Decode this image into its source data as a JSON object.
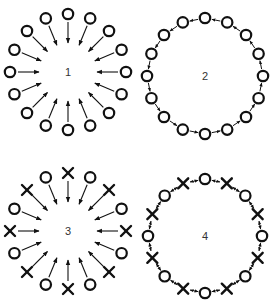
{
  "colors": {
    "stroke": "#111111",
    "label": "#333333",
    "background": "#ffffff"
  },
  "diagrams": [
    {
      "id": "1",
      "label": "1",
      "type": "centripetal",
      "center": [
        68,
        72
      ],
      "radius": 58,
      "node_count": 16,
      "nodes": [
        "O",
        "O",
        "O",
        "O",
        "O",
        "O",
        "O",
        "O",
        "O",
        "O",
        "O",
        "O",
        "O",
        "O",
        "O",
        "O"
      ],
      "arrows": "inward"
    },
    {
      "id": "2",
      "label": "2",
      "type": "ring",
      "center": [
        205,
        76
      ],
      "radius": 58,
      "node_count": 16,
      "nodes": [
        "O",
        "O",
        "O",
        "O",
        "O",
        "O",
        "O",
        "O",
        "O",
        "O",
        "O",
        "O",
        "O",
        "O",
        "O",
        "O"
      ],
      "arrows": "neighbor-single"
    },
    {
      "id": "3",
      "label": "3",
      "type": "centripetal",
      "center": [
        68,
        231
      ],
      "radius": 58,
      "node_count": 16,
      "nodes": [
        "X",
        "O",
        "X",
        "O",
        "X",
        "O",
        "X",
        "O",
        "X",
        "O",
        "X",
        "O",
        "X",
        "O",
        "X",
        "O"
      ],
      "arrows": "inward"
    },
    {
      "id": "4",
      "label": "4",
      "type": "ring",
      "center": [
        205,
        236
      ],
      "radius": 57,
      "node_count": 16,
      "nodes": [
        "O",
        "X",
        "O",
        "X",
        "O",
        "X",
        "O",
        "X",
        "O",
        "X",
        "O",
        "X",
        "O",
        "X",
        "O",
        "X"
      ],
      "arrows": "neighbor-double"
    }
  ]
}
